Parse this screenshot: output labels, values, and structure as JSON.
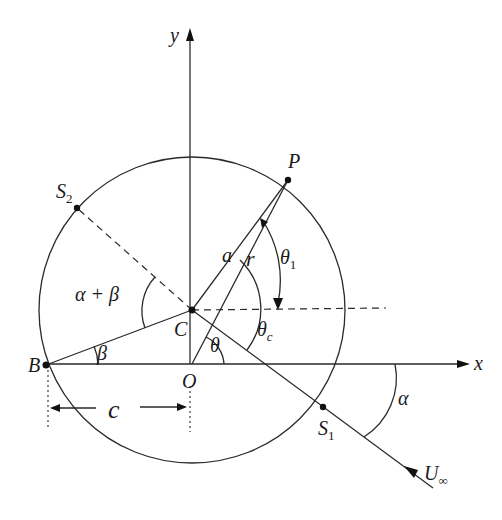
{
  "diagram": {
    "type": "geometry",
    "axes": {
      "x_label": "x",
      "y_label": "y"
    },
    "points": {
      "P": "P",
      "C": "C",
      "O": "O",
      "B": "B",
      "S1": {
        "main": "S",
        "sub": "1"
      },
      "S2": {
        "main": "S",
        "sub": "2"
      }
    },
    "lengths": {
      "a": "a",
      "r": "r",
      "c": "c"
    },
    "angles": {
      "theta": "θ",
      "theta_1": {
        "main": "θ",
        "sub": "1"
      },
      "theta_c": {
        "main": "θ",
        "sub": "c"
      },
      "alpha": "α",
      "alpha_plus_beta": "α + β",
      "beta": "β"
    },
    "flow": {
      "main": "U",
      "sub": "∞"
    },
    "colors": {
      "ink": "#2a2a2a",
      "background": "#ffffff"
    }
  }
}
